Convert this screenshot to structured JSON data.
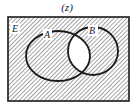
{
  "diagram": {
    "type": "venn",
    "title": "(z)",
    "universe_label": "E",
    "sets": [
      {
        "id": "A",
        "label": "A"
      },
      {
        "id": "B",
        "label": "B"
      }
    ],
    "shaded_region": "complement of A ∩ B",
    "unshaded_region": "A ∩ B",
    "colors": {
      "outline": "#1a1a1a",
      "hatch": "#555555",
      "background": "#ffffff"
    }
  }
}
